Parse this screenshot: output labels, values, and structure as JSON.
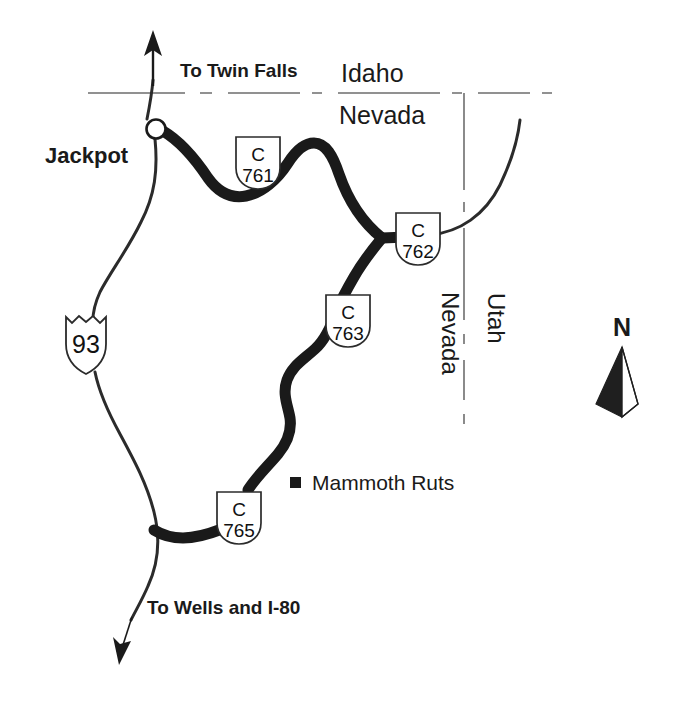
{
  "map": {
    "title": "Jackpot Nevada county route map",
    "background_color": "#ffffff",
    "ink_color": "#1a1a1a",
    "major_road_color": "#1a1a1a",
    "minor_road_color": "#2b2b2b",
    "boundary_color": "#6e6e6e"
  },
  "places": {
    "jackpot_label": "Jackpot",
    "mammoth_ruts_label": "Mammoth Ruts"
  },
  "states": {
    "idaho_label": "Idaho",
    "nevada_north_label": "Nevada",
    "nevada_east_label": "Nevada",
    "utah_label": "Utah"
  },
  "directions": {
    "to_twin_falls": "To Twin Falls",
    "to_wells_i80": "To Wells and I-80"
  },
  "compass": {
    "north_label": "N"
  },
  "shields": [
    {
      "id": "us93",
      "type": "us-highway-shield",
      "prefix": "",
      "number": "93",
      "label": "93"
    },
    {
      "id": "c761",
      "type": "county-route-shield",
      "prefix": "C",
      "number": "761",
      "label": "C 761"
    },
    {
      "id": "c762",
      "type": "county-route-shield",
      "prefix": "C",
      "number": "762",
      "label": "C 762"
    },
    {
      "id": "c763",
      "type": "county-route-shield",
      "prefix": "C",
      "number": "763",
      "label": "C 763"
    },
    {
      "id": "c765",
      "type": "county-route-shield",
      "prefix": "C",
      "number": "765",
      "label": "C 765"
    }
  ],
  "legend": {
    "site_marker_shape": "filled-square"
  }
}
